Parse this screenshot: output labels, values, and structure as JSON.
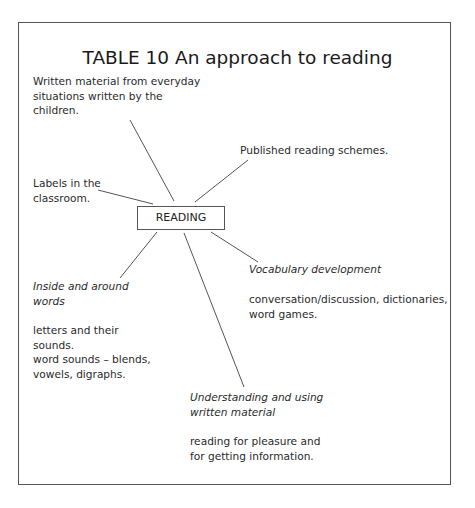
{
  "title": "TABLE 10 An approach to reading",
  "center": "READING",
  "nodes": {
    "written_material": [
      "Written material from everyday",
      "situations written by the",
      "children."
    ],
    "published": [
      "Published reading schemes."
    ],
    "labels": [
      "Labels in the",
      "classroom."
    ],
    "inside_heading": [
      "Inside and around",
      "words"
    ],
    "inside_body": [
      "letters and their",
      "sounds.",
      "word sounds – blends,",
      "vowels, digraphs."
    ],
    "vocab_heading": [
      "Vocabulary development"
    ],
    "vocab_body": [
      "conversation/discussion, dictionaries,",
      "word games."
    ],
    "understanding_heading": [
      "Understanding and using",
      "written material"
    ],
    "understanding_body": [
      "reading for pleasure and",
      "for getting information."
    ]
  },
  "colors": {
    "line": "#555555",
    "text": "#222222"
  }
}
